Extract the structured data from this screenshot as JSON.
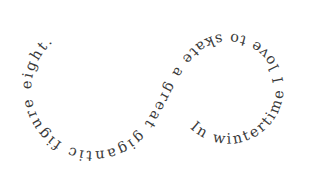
{
  "artwork": {
    "type": "text-on-path",
    "shape": "figure-eight",
    "text": "In wintertime I love to skate a great gigantic figure eight.",
    "text_color": "#3a3a3a",
    "background": "#ffffff"
  }
}
